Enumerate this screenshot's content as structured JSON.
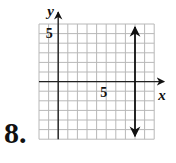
{
  "problem": {
    "number_label": "8."
  },
  "chart_data": {
    "type": "line",
    "title": "",
    "xlabel": "x",
    "ylabel": "y",
    "xlim": [
      -2,
      10
    ],
    "ylim": [
      -6,
      6
    ],
    "grid": true,
    "grid_step": 1,
    "tick_labels": {
      "x": [
        {
          "value": 5,
          "label": "5"
        }
      ],
      "y": [
        {
          "value": 5,
          "label": "5"
        }
      ]
    },
    "series": [
      {
        "name": "x = 8",
        "kind": "vertical-line",
        "x": 8,
        "y_from": -6,
        "y_to": 6,
        "arrows": "both"
      }
    ]
  },
  "colors": {
    "grid": "#b8b8b8",
    "axis": "#222222",
    "line": "#111111",
    "text": "#111111"
  }
}
